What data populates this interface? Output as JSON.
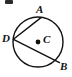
{
  "figure": {
    "type": "circle-geometry-diagram",
    "background_color": "#ffffff",
    "stroke_color": "#111111",
    "stroke_width": 1.4,
    "circle": {
      "center_label": "C",
      "center_x": 38,
      "center_y": 42,
      "radius": 25,
      "center_dot_radius": 2.4
    },
    "points": [
      {
        "label": "A",
        "x": 41,
        "y": 17.6,
        "label_x": 36,
        "label_y": 4
      },
      {
        "label": "B",
        "x": 59.5,
        "y": 62.6,
        "label_x": 60,
        "label_y": 61
      },
      {
        "label": "D",
        "x": 13.4,
        "y": 39.3,
        "label_x": 2,
        "label_y": 33
      },
      {
        "label": "C",
        "x": 38,
        "y": 42,
        "label_x": 43,
        "label_y": 34
      }
    ],
    "chords": [
      {
        "name": "chord-DA",
        "from": "D",
        "to": "A"
      },
      {
        "name": "chord-DB",
        "from": "D",
        "to": "B"
      }
    ],
    "cropped_mark": {
      "present": true,
      "x": 5,
      "y": 0,
      "width": 8,
      "height": 4,
      "color": "#2b2b2b"
    }
  }
}
